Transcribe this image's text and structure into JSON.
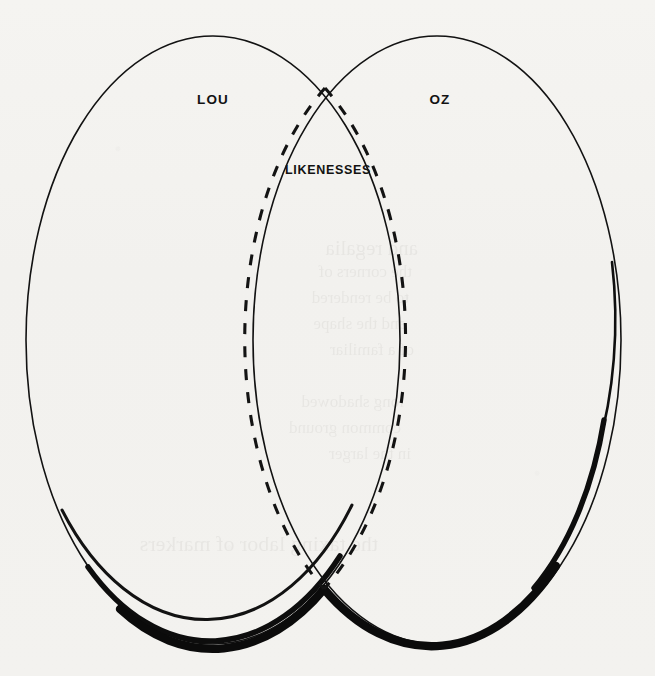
{
  "diagram": {
    "type": "venn-diagram",
    "background_color": "#f2f1ee",
    "ink_color": "#121212",
    "sets": [
      {
        "id": "lou",
        "label": "LOU",
        "label_x": 213,
        "label_y": 99,
        "center_x": 213,
        "center_y": 340,
        "radius_x": 187,
        "radius_y": 304,
        "stroke_style": "solid",
        "thin_stroke_width": 1.6,
        "thick_stroke_width": 8.5
      },
      {
        "id": "oz",
        "label": "OZ",
        "label_x": 440,
        "label_y": 99,
        "center_x": 437,
        "center_y": 340,
        "radius_x": 184,
        "radius_y": 304,
        "stroke_style": "solid",
        "thin_stroke_width": 1.6,
        "thick_stroke_width": 8.5
      }
    ],
    "intersection": {
      "id": "likenesses",
      "label": "LIKENESSES",
      "label_x": 328,
      "label_y": 170,
      "stroke_style": "dashed",
      "dash_pattern": "11 12",
      "stroke_width": 3.1,
      "top_crossing_x": 325,
      "top_crossing_y": 88,
      "bottom_crossing_x": 324,
      "bottom_crossing_y": 589
    },
    "ghost_text": [
      {
        "text": "and regalia",
        "x": 418,
        "y": 236,
        "size": 21
      },
      {
        "text": "the corners of",
        "x": 412,
        "y": 262,
        "size": 17
      },
      {
        "text": "to be rendered",
        "x": 409,
        "y": 288,
        "size": 17
      },
      {
        "text": "and the shape",
        "x": 406,
        "y": 314,
        "size": 17
      },
      {
        "text": "of a familiar",
        "x": 414,
        "y": 340,
        "size": 17
      },
      {
        "text": "long shadowed",
        "x": 404,
        "y": 392,
        "size": 17
      },
      {
        "text": "common ground",
        "x": 401,
        "y": 418,
        "size": 17
      },
      {
        "text": "in the larger",
        "x": 411,
        "y": 444,
        "size": 17
      },
      {
        "text": "the taxing labor of markers",
        "x": 378,
        "y": 531,
        "size": 22
      }
    ]
  }
}
